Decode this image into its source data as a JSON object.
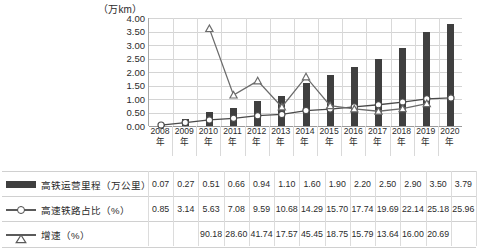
{
  "chart_data": {
    "type": "bar",
    "title": "（万km）",
    "xlabel": "",
    "ylabel": "（万km）",
    "ylim": [
      0,
      4
    ],
    "ytick_labels": [
      "4.00",
      "3.50",
      "3.00",
      "2.50",
      "2.00",
      "1.50",
      "1.00",
      "0.50",
      "0.00"
    ],
    "ytick_values": [
      4.0,
      3.5,
      3.0,
      2.5,
      2.0,
      1.5,
      1.0,
      0.5,
      0.0
    ],
    "grid": true,
    "legend_position": "table-below",
    "secondary_axis_scale_units_per_major": 25,
    "categories": [
      "2008年",
      "2009年",
      "2010年",
      "2011年",
      "2012年",
      "2013年",
      "2014年",
      "2015年",
      "2016年",
      "2017年",
      "2018年",
      "2019年",
      "2020年"
    ],
    "series": [
      {
        "name": "高铁运营里程（万公里）",
        "type": "bar",
        "marker": "none",
        "color": "#3f3f3f",
        "values": [
          0.07,
          0.27,
          0.51,
          0.66,
          0.94,
          1.1,
          1.6,
          1.9,
          2.2,
          2.5,
          2.9,
          3.5,
          3.79
        ]
      },
      {
        "name": "高速铁路占比（%）",
        "type": "line",
        "marker": "circle",
        "color": "#4a4a4a",
        "values": [
          0.85,
          3.14,
          5.63,
          7.08,
          9.59,
          10.68,
          14.29,
          15.7,
          17.74,
          19.69,
          22.14,
          25.18,
          25.96
        ]
      },
      {
        "name": "增速（%）",
        "type": "line",
        "marker": "triangle",
        "color": "#6b6b6b",
        "values": [
          null,
          null,
          90.18,
          28.6,
          41.74,
          17.57,
          45.45,
          18.75,
          15.79,
          13.64,
          16.0,
          20.69,
          null
        ]
      }
    ]
  },
  "table": {
    "rows": [
      {
        "legend_icon": "bar-swatch-icon",
        "label": "高铁运营里程（万公里）",
        "values": [
          "0.07",
          "0.27",
          "0.51",
          "0.66",
          "0.94",
          "1.10",
          "1.60",
          "1.90",
          "2.20",
          "2.50",
          "2.90",
          "3.50",
          "3.79"
        ]
      },
      {
        "legend_icon": "line-circle-swatch-icon",
        "label": "高速铁路占比（%）",
        "values": [
          "0.85",
          "3.14",
          "5.63",
          "7.08",
          "9.59",
          "10.68",
          "14.29",
          "15.70",
          "17.74",
          "19.69",
          "22.14",
          "25.18",
          "25.96"
        ]
      },
      {
        "legend_icon": "line-triangle-swatch-icon",
        "label": "增速（%）",
        "values": [
          "",
          "",
          "90.18",
          "28.60",
          "41.74",
          "17.57",
          "45.45",
          "18.75",
          "15.79",
          "13.64",
          "16.00",
          "20.69",
          ""
        ]
      }
    ]
  },
  "axis": {
    "unit_label": "（万km）",
    "x_categories": [
      "2008",
      "2009",
      "2010",
      "2011",
      "2012",
      "2013",
      "2014",
      "2015",
      "2016",
      "2017",
      "2018",
      "2019",
      "2020"
    ],
    "x_suffix": "年"
  },
  "colors": {
    "bar": "#3f3f3f",
    "line_share": "#4a4a4a",
    "line_growth": "#6b6b6b",
    "grid": "#d4d4d4",
    "axis": "#9a9a9a"
  }
}
